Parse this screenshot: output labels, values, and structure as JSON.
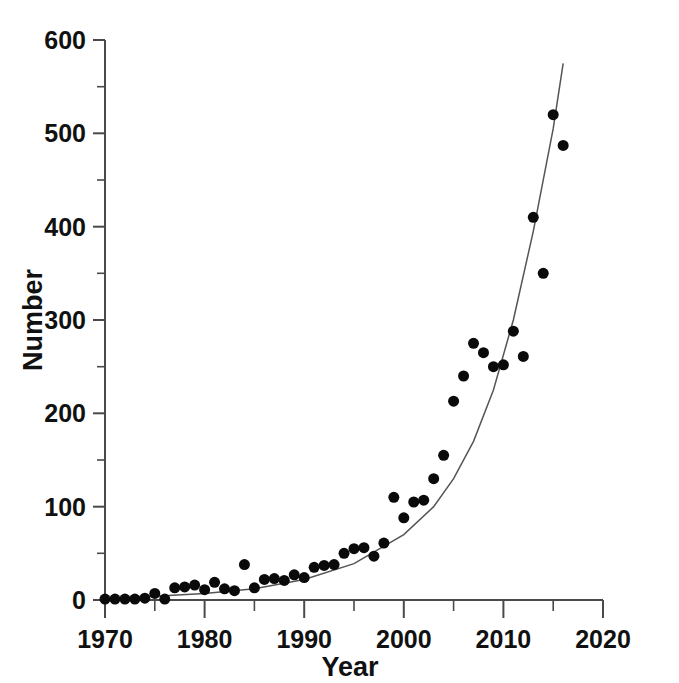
{
  "chart_data": {
    "type": "scatter",
    "title": "",
    "xlabel": "Year",
    "ylabel": "Number",
    "xlim": [
      1970,
      2020
    ],
    "ylim": [
      0,
      600
    ],
    "xticks": [
      1970,
      1980,
      1990,
      2000,
      2010,
      2020
    ],
    "xtick_labels": [
      "1970",
      "1980",
      "1990",
      "2000",
      "2010",
      "2020"
    ],
    "yticks": [
      0,
      100,
      200,
      300,
      400,
      500,
      600
    ],
    "ytick_labels": [
      "0",
      "100",
      "200",
      "300",
      "400",
      "500",
      "600"
    ],
    "yminor_ticks": [
      50,
      150,
      250,
      350,
      450,
      550
    ],
    "grid": false,
    "legend": "none",
    "x": [
      1970,
      1971,
      1972,
      1973,
      1974,
      1975,
      1976,
      1977,
      1978,
      1979,
      1980,
      1981,
      1982,
      1983,
      1984,
      1985,
      1986,
      1987,
      1988,
      1989,
      1990,
      1991,
      1992,
      1993,
      1994,
      1995,
      1996,
      1997,
      1998,
      1999,
      2000,
      2001,
      2002,
      2003,
      2004,
      2005,
      2006,
      2007,
      2008,
      2009,
      2010,
      2011,
      2012,
      2013,
      2014,
      2015,
      2016,
      2017
    ],
    "values": [
      1,
      1,
      1,
      1,
      2,
      7,
      1,
      13,
      14,
      16,
      11,
      19,
      12,
      10,
      38,
      13,
      22,
      23,
      21,
      27,
      24,
      35,
      37,
      38,
      50,
      55,
      56,
      47,
      61,
      110,
      88,
      105,
      107,
      130,
      155,
      213,
      240,
      275,
      265,
      250,
      252,
      288,
      261,
      410,
      350,
      520,
      487,
      487
    ],
    "series": [
      {
        "name": "observed",
        "points": [
          [
            1970,
            1
          ],
          [
            1971,
            1
          ],
          [
            1972,
            1
          ],
          [
            1973,
            1
          ],
          [
            1974,
            2
          ],
          [
            1975,
            7
          ],
          [
            1976,
            1
          ],
          [
            1977,
            13
          ],
          [
            1978,
            14
          ],
          [
            1979,
            16
          ],
          [
            1980,
            11
          ],
          [
            1981,
            19
          ],
          [
            1982,
            12
          ],
          [
            1983,
            10
          ],
          [
            1984,
            38
          ],
          [
            1985,
            13
          ],
          [
            1986,
            22
          ],
          [
            1987,
            23
          ],
          [
            1988,
            21
          ],
          [
            1989,
            27
          ],
          [
            1990,
            24
          ],
          [
            1991,
            35
          ],
          [
            1992,
            37
          ],
          [
            1993,
            38
          ],
          [
            1994,
            50
          ],
          [
            1995,
            55
          ],
          [
            1996,
            56
          ],
          [
            1997,
            47
          ],
          [
            1998,
            61
          ],
          [
            1999,
            110
          ],
          [
            2000,
            88
          ],
          [
            2001,
            105
          ],
          [
            2002,
            107
          ],
          [
            2003,
            130
          ],
          [
            2004,
            155
          ],
          [
            2005,
            213
          ],
          [
            2006,
            240
          ],
          [
            2007,
            275
          ],
          [
            2008,
            265
          ],
          [
            2009,
            250
          ],
          [
            2010,
            252
          ],
          [
            2011,
            288
          ],
          [
            2012,
            261
          ],
          [
            2013,
            410
          ],
          [
            2014,
            350
          ],
          [
            2015,
            520
          ],
          [
            2016,
            487
          ]
        ]
      },
      {
        "name": "exponential-fit",
        "curve": [
          [
            1970,
            2
          ],
          [
            1975,
            4
          ],
          [
            1980,
            7
          ],
          [
            1985,
            12
          ],
          [
            1990,
            22
          ],
          [
            1995,
            39
          ],
          [
            2000,
            70
          ],
          [
            2003,
            100
          ],
          [
            2005,
            130
          ],
          [
            2007,
            170
          ],
          [
            2009,
            225
          ],
          [
            2011,
            300
          ],
          [
            2013,
            395
          ],
          [
            2015,
            505
          ],
          [
            2016,
            575
          ]
        ]
      }
    ],
    "colors": {
      "point": "#0a0a0a",
      "curve": "#555555",
      "axis": "#4a4a4a",
      "text": "#111111",
      "background": "#ffffff"
    },
    "point_radius": 5.5
  }
}
